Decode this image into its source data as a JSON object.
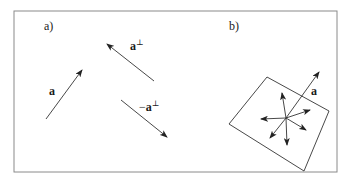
{
  "frame": {
    "x": 14,
    "y": 11,
    "width": 323,
    "height": 161,
    "stroke": "#8a8a8a"
  },
  "colors": {
    "line": "#333333",
    "text": "#1a1a1a"
  },
  "panel_a": {
    "label": "a)",
    "label_pos": [
      44,
      30
    ],
    "vectors": [
      {
        "name": "a",
        "text": "a",
        "sup": "",
        "prefix": "",
        "from": [
          46,
          119
        ],
        "to": [
          82,
          70
        ],
        "label_pos": [
          49,
          95
        ]
      },
      {
        "name": "a-perp",
        "text": "a",
        "sup": "⊥",
        "prefix": "",
        "from": [
          154,
          81
        ],
        "to": [
          107,
          44
        ],
        "label_pos": [
          130,
          50
        ]
      },
      {
        "name": "neg-a-perp",
        "text": "a",
        "sup": "⊥",
        "prefix": "−",
        "from": [
          121,
          100
        ],
        "to": [
          167,
          137
        ],
        "label_pos": [
          139,
          111
        ]
      }
    ]
  },
  "panel_b": {
    "label": "b)",
    "label_pos": [
      229,
      30
    ],
    "plane_polygon": [
      [
        267,
        77
      ],
      [
        329,
        111
      ],
      [
        304,
        171
      ],
      [
        229,
        124
      ]
    ],
    "center": [
      286,
      118
    ],
    "normal_vector": {
      "text": "a",
      "to": [
        319,
        72
      ],
      "label_pos": [
        311,
        95
      ]
    },
    "plane_vectors": [
      [
        282,
        93
      ],
      [
        261,
        119
      ],
      [
        310,
        110
      ],
      [
        306,
        130
      ],
      [
        270,
        138
      ],
      [
        287,
        145
      ]
    ]
  }
}
